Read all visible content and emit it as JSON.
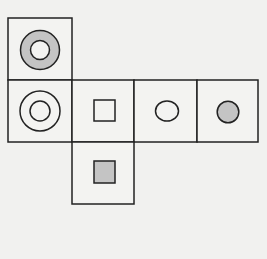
{
  "diagram": {
    "type": "cube-net",
    "colors": {
      "background": "#f1f1ef",
      "stroke": "#222222",
      "face_fill": "#f3f3f1",
      "gray_fill": "#c4c4c4"
    },
    "faces": [
      {
        "id": "top",
        "row": 0,
        "col": 0,
        "symbol": "gray-ring"
      },
      {
        "id": "left",
        "row": 1,
        "col": 0,
        "symbol": "double-circle"
      },
      {
        "id": "front",
        "row": 1,
        "col": 1,
        "symbol": "white-square"
      },
      {
        "id": "right",
        "row": 1,
        "col": 2,
        "symbol": "white-oval"
      },
      {
        "id": "back",
        "row": 1,
        "col": 3,
        "symbol": "gray-circle"
      },
      {
        "id": "bottom",
        "row": 2,
        "col": 1,
        "symbol": "gray-square"
      }
    ]
  }
}
